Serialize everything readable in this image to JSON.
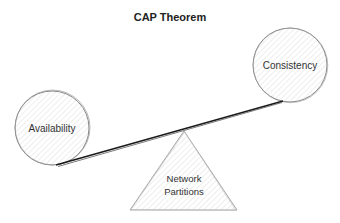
{
  "title": "CAP Theorem",
  "nodes": {
    "availability": {
      "label": "Availability"
    },
    "consistency": {
      "label": "Consistency"
    },
    "partitions": {
      "line1": "Network",
      "line2": "Partitions"
    }
  },
  "colors": {
    "stroke": "#8a8a8a",
    "hatch": "#d6d6d6",
    "beam": "#1a1a1a",
    "text": "#333333"
  }
}
